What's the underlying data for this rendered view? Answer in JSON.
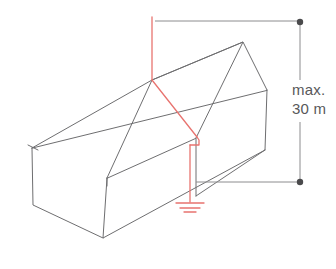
{
  "figure": {
    "background_color": "#ffffff"
  },
  "colors": {
    "building_line": "#6e6e70",
    "conductor": "#e8736f",
    "dimension_line": "#8c8c8e",
    "dimension_text": "#58585a"
  },
  "dimension": {
    "label_max": "max.",
    "label_height": "30 m",
    "value": 30,
    "unit": "m",
    "qualifier": "max.",
    "line_x": 300,
    "top_point_y": 22,
    "bottom_point_y": 182
  },
  "building": {
    "name": "gabled-building",
    "style": "isometric-wireframe",
    "stroke_width": 1,
    "outline_points": {
      "ridge_near": [
        152,
        80
      ],
      "ridge_far": [
        243,
        42
      ],
      "eave_front_near": [
        107,
        178
      ],
      "eave_front_far": [
        196,
        138
      ],
      "eave_back_near": [
        32,
        148
      ],
      "eave_back_far": [
        267,
        90
      ],
      "wall_base_left": [
        33,
        205
      ],
      "wall_base_front": [
        103,
        238
      ],
      "wall_base_right": [
        265,
        150
      ]
    }
  },
  "lightning_protection": {
    "air_terminal": {
      "name": "air-termination-rod",
      "top": [
        152,
        17
      ],
      "bottom": [
        152,
        80
      ]
    },
    "roof_conductor": {
      "name": "roof-down-conductor",
      "from": [
        152,
        80
      ],
      "to": [
        196,
        137
      ]
    },
    "down_conductor": {
      "name": "wall-down-conductor",
      "from": [
        190,
        145
      ],
      "to": [
        190,
        202
      ]
    },
    "earth_symbol": {
      "name": "earth-ground-symbol",
      "center_x": 190,
      "top_y": 202,
      "bars": 3
    }
  },
  "icons": {
    "ground": "earth-ground-icon",
    "dimension_dot": "dimension-endpoint-dot"
  }
}
